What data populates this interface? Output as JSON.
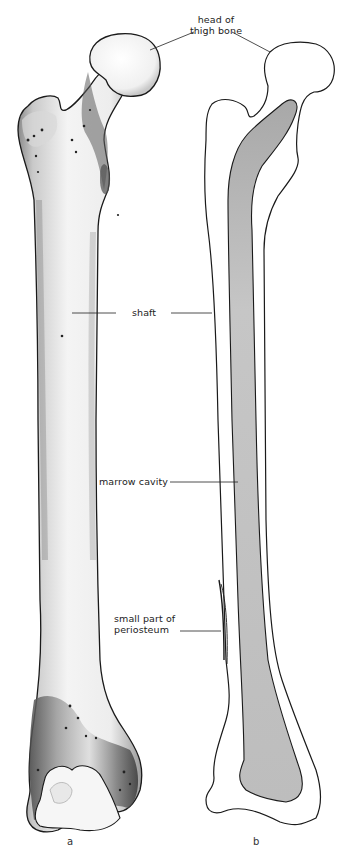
{
  "figure": {
    "panels": [
      {
        "id": "a",
        "letter": "a",
        "description": "shaded drawing of thigh bone (femur) exterior"
      },
      {
        "id": "b",
        "letter": "b",
        "description": "outline section of thigh bone showing marrow cavity"
      }
    ],
    "labels": {
      "head": {
        "line1": "head of",
        "line2": "thigh bone"
      },
      "shaft": "shaft",
      "marrow": "marrow cavity",
      "periosteum": {
        "line1": "small part of",
        "line2": "periosteum"
      }
    },
    "colors": {
      "outline": "#1a1a1a",
      "marrow_fill": "#b9b9b9",
      "bone_light": "#f2f2f2",
      "bone_shade": "#6a6a6a",
      "background": "#ffffff"
    }
  }
}
